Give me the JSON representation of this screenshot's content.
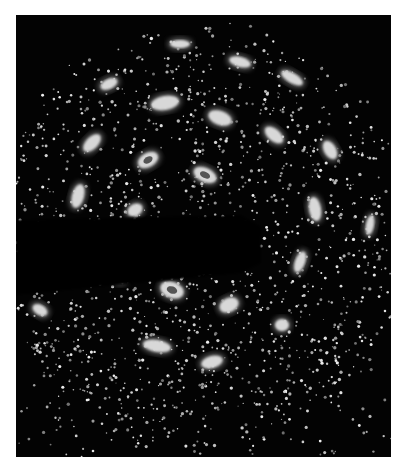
{
  "figure": {
    "background_color": "#030303",
    "page_color": "#ffffff",
    "spot_color": "#d8d8d8",
    "core_color": "#555555",
    "frame": {
      "x": 16,
      "y": 15,
      "width": 375,
      "height": 442
    },
    "center": {
      "x": 200,
      "y": 235
    },
    "beam_stop": {
      "points": "0,205 225,200 245,212 245,248 225,258 0,280"
    },
    "spots": [
      {
        "cx": 165,
        "cy": 103,
        "rx": 14,
        "ry": 7,
        "rot": -10,
        "core": false
      },
      {
        "cx": 220,
        "cy": 118,
        "rx": 12,
        "ry": 7,
        "rot": 20,
        "core": false
      },
      {
        "cx": 274,
        "cy": 135,
        "rx": 11,
        "ry": 6,
        "rot": 40,
        "core": false
      },
      {
        "cx": 330,
        "cy": 150,
        "rx": 10,
        "ry": 6,
        "rot": 60,
        "core": false
      },
      {
        "cx": 148,
        "cy": 160,
        "rx": 11,
        "ry": 7,
        "rot": -30,
        "core": true
      },
      {
        "cx": 205,
        "cy": 175,
        "rx": 12,
        "ry": 7,
        "rot": 25,
        "core": true
      },
      {
        "cx": 92,
        "cy": 143,
        "rx": 11,
        "ry": 6,
        "rot": -45,
        "core": false
      },
      {
        "cx": 78,
        "cy": 196,
        "rx": 6,
        "ry": 12,
        "rot": 15,
        "core": false
      },
      {
        "cx": 135,
        "cy": 210,
        "rx": 8,
        "ry": 6,
        "rot": -30,
        "core": false
      },
      {
        "cx": 315,
        "cy": 209,
        "rx": 6,
        "ry": 12,
        "rot": -10,
        "core": false
      },
      {
        "cx": 245,
        "cy": 245,
        "rx": 8,
        "ry": 13,
        "rot": 15,
        "core": true
      },
      {
        "cx": 300,
        "cy": 262,
        "rx": 5,
        "ry": 11,
        "rot": 20,
        "core": false
      },
      {
        "cx": 185,
        "cy": 262,
        "rx": 10,
        "ry": 6,
        "rot": -15,
        "core": false
      },
      {
        "cx": 120,
        "cy": 278,
        "rx": 6,
        "ry": 5,
        "rot": 0,
        "core": false
      },
      {
        "cx": 172,
        "cy": 290,
        "rx": 12,
        "ry": 8,
        "rot": 20,
        "core": true
      },
      {
        "cx": 229,
        "cy": 305,
        "rx": 10,
        "ry": 7,
        "rot": -25,
        "core": false
      },
      {
        "cx": 282,
        "cy": 325,
        "rx": 7,
        "ry": 6,
        "rot": 0,
        "core": false
      },
      {
        "cx": 157,
        "cy": 346,
        "rx": 14,
        "ry": 6,
        "rot": 10,
        "core": false
      },
      {
        "cx": 212,
        "cy": 362,
        "rx": 11,
        "ry": 6,
        "rot": -15,
        "core": false
      },
      {
        "cx": 240,
        "cy": 62,
        "rx": 11,
        "ry": 5,
        "rot": 15,
        "core": false
      },
      {
        "cx": 292,
        "cy": 78,
        "rx": 12,
        "ry": 5,
        "rot": 30,
        "core": false
      },
      {
        "cx": 109,
        "cy": 84,
        "rx": 9,
        "ry": 5,
        "rot": -25,
        "core": false
      },
      {
        "cx": 180,
        "cy": 44,
        "rx": 10,
        "ry": 4,
        "rot": 0,
        "core": false
      },
      {
        "cx": 370,
        "cy": 225,
        "rx": 4,
        "ry": 10,
        "rot": 10,
        "core": false
      },
      {
        "cx": 40,
        "cy": 310,
        "rx": 8,
        "ry": 5,
        "rot": 30,
        "core": false
      }
    ],
    "speckle": {
      "count": 2600,
      "seed": 7,
      "ring_center_x": 200,
      "ring_center_y": 235,
      "ring_radius": 190
    }
  }
}
